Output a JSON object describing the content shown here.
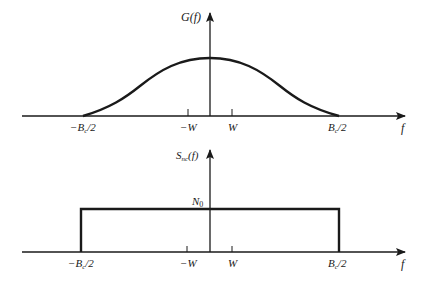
{
  "figure": {
    "top_plot": {
      "y_label": "G(f)",
      "x_label": "f",
      "shape": "raised-cosine (bell) curve",
      "ticks": [
        {
          "label": "−B_c/2",
          "text_main": "−B",
          "sub": "c",
          "text_tail": "/2"
        },
        {
          "label": "−W",
          "text_main": "−W"
        },
        {
          "label": "W",
          "text_main": "W"
        },
        {
          "label": "B_c/2",
          "text_main": "B",
          "sub": "c",
          "text_tail": "/2"
        }
      ]
    },
    "bottom_plot": {
      "y_label": "S_nc(f)",
      "y_label_main": "S",
      "y_label_sub": "nc",
      "y_label_tail": "(f)",
      "x_label": "f",
      "level_label": "N",
      "level_sub": "0",
      "shape": "rectangle",
      "ticks": [
        {
          "label": "−B_c/2",
          "text_main": "−B",
          "sub": "c",
          "text_tail": "/2"
        },
        {
          "label": "−W",
          "text_main": "−W"
        },
        {
          "label": "W",
          "text_main": "W"
        },
        {
          "label": "B_c/2",
          "text_main": "B",
          "sub": "c",
          "text_tail": "/2"
        }
      ]
    }
  },
  "colors": {
    "ink": "#1a1a1a",
    "background": "#ffffff"
  }
}
